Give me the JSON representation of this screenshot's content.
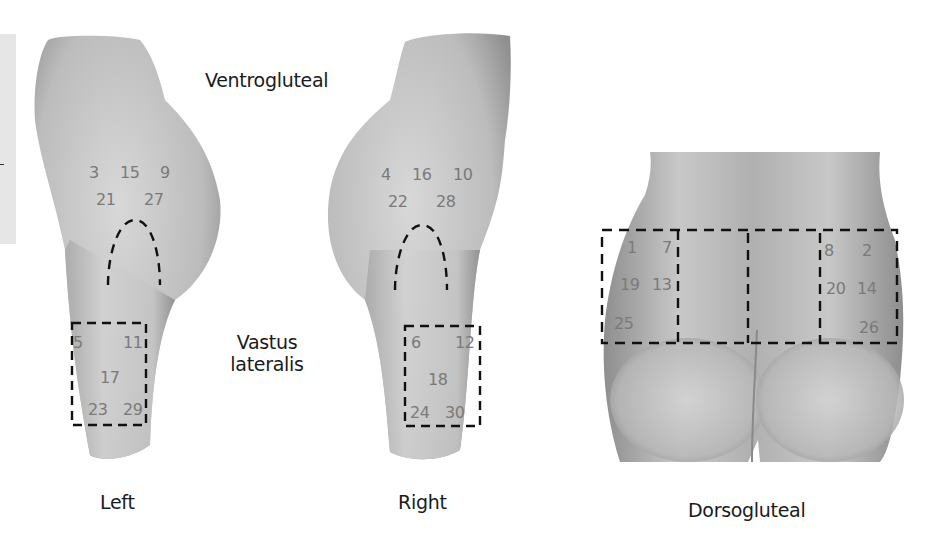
{
  "labels": {
    "ventrogluteal": "Ventrogluteal",
    "vastus_line1": "Vastus",
    "vastus_line2": "lateralis",
    "left": "Left",
    "right": "Right",
    "dorsogluteal": "Dorsogluteal"
  },
  "left_thigh": {
    "ventrogluteal_sites": [
      "3",
      "15",
      "9",
      "21",
      "27"
    ],
    "vastus_sites": [
      "5",
      "11",
      "17",
      "23",
      "29"
    ]
  },
  "right_thigh": {
    "ventrogluteal_sites": [
      "4",
      "16",
      "10",
      "22",
      "28"
    ],
    "vastus_sites": [
      "6",
      "12",
      "18",
      "24",
      "30"
    ]
  },
  "dorsogluteal": {
    "left_sites": [
      "1",
      "7",
      "19",
      "13",
      "25"
    ],
    "right_sites": [
      "8",
      "2",
      "20",
      "14",
      "26"
    ]
  },
  "colors": {
    "body_light": "#d6d6d6",
    "body_dark": "#8a8a8a",
    "site_number": "#7a7a7a",
    "dash_line": "#111111",
    "label_text": "#1a1a1a"
  }
}
